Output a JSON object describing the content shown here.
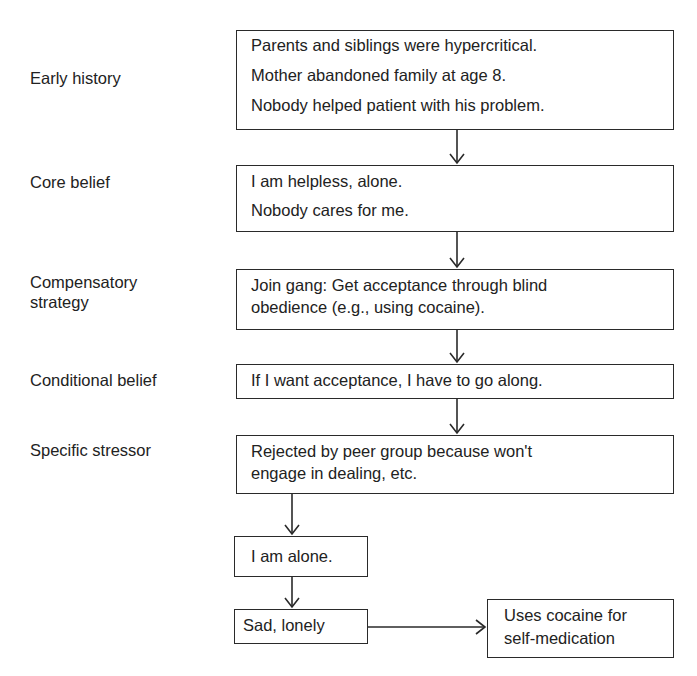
{
  "diagram": {
    "type": "flowchart",
    "rows": [
      {
        "label": "Early history",
        "box_lines": [
          "Parents and siblings were hypercritical.",
          "Mother abandoned family at age 8.",
          "Nobody helped patient with his problem."
        ]
      },
      {
        "label": "Core belief",
        "box_lines": [
          "I am helpless, alone.",
          "Nobody cares for me."
        ]
      },
      {
        "label_lines": [
          "Compensatory",
          "strategy"
        ],
        "box_lines": [
          "Join gang: Get acceptance through blind",
          "obedience (e.g., using cocaine)."
        ]
      },
      {
        "label": "Conditional belief",
        "box_lines": [
          "If I want acceptance, I have to go along."
        ]
      },
      {
        "label": "Specific stressor",
        "box_lines": [
          "Rejected by peer group because won't",
          "engage in dealing, etc."
        ]
      }
    ],
    "thought": "I am alone.",
    "emotion": "Sad, lonely",
    "behavior_lines": [
      "Uses cocaine for",
      "self-medication"
    ],
    "colors": {
      "line": "#2a2a2a",
      "text": "#222222",
      "background": "#ffffff"
    }
  }
}
